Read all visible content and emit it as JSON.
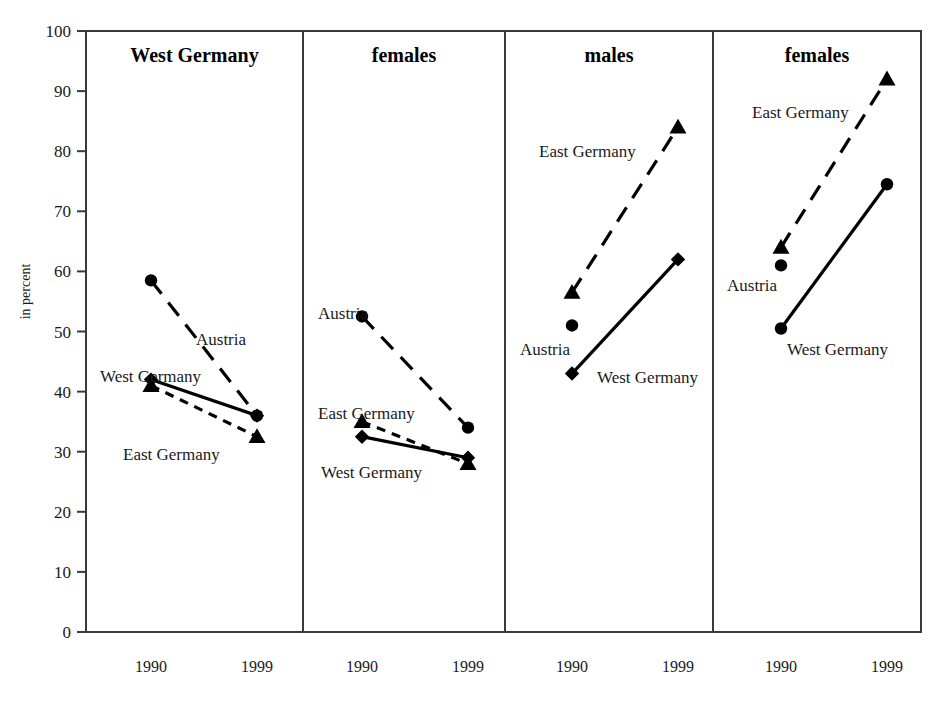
{
  "figure": {
    "y_axis_title": "in percent",
    "background": "#ffffff",
    "ink_color": "#000000"
  },
  "chart_data": {
    "type": "line",
    "title": "",
    "subtitle": "",
    "xlabel": "",
    "ylabel": "in percent",
    "ylim": [
      0,
      100
    ],
    "ytick_labels": [
      "0",
      "10",
      "20",
      "30",
      "40",
      "50",
      "60",
      "70",
      "80",
      "90",
      "100"
    ],
    "yticks": [
      0,
      10,
      20,
      30,
      40,
      50,
      60,
      70,
      80,
      90,
      100
    ],
    "grid": false,
    "legend_position": "inline-annotations",
    "x": [
      "1990",
      "1999"
    ],
    "panels": [
      {
        "title": "West Germany",
        "xtick_labels": [
          "1990",
          "1999"
        ],
        "series": [
          {
            "name": "Austria",
            "marker": "circle",
            "linestyle": "long-dash",
            "values": [
              58.5,
              36.0
            ],
            "label": "Austria",
            "label_x": 1999,
            "label_y": 1990
          },
          {
            "name": "West Germany",
            "marker": "diamond",
            "linestyle": "solid",
            "values": [
              42.0,
              36.0
            ],
            "label": "West Germany"
          },
          {
            "name": "East Germany",
            "marker": "triangle",
            "linestyle": "short-dash",
            "values": [
              41.0,
              32.5
            ],
            "label": "East Germany"
          }
        ]
      },
      {
        "title": "females",
        "xtick_labels": [
          "1990",
          "1999"
        ],
        "series": [
          {
            "name": "Austria",
            "marker": "circle",
            "linestyle": "long-dash",
            "values": [
              52.5,
              34.0
            ],
            "label": "Austria"
          },
          {
            "name": "East Germany",
            "marker": "triangle",
            "linestyle": "short-dash",
            "values": [
              35.0,
              28.0
            ],
            "label": "East Germany"
          },
          {
            "name": "West Germany",
            "marker": "diamond",
            "linestyle": "solid",
            "values": [
              32.5,
              29.0
            ],
            "label": "West Germany"
          }
        ]
      },
      {
        "title": "males",
        "xtick_labels": [
          "1990",
          "1999"
        ],
        "series": [
          {
            "name": "East Germany",
            "marker": "triangle",
            "linestyle": "long-dash",
            "values": [
              56.5,
              84.0
            ],
            "label": "East Germany"
          },
          {
            "name": "Austria",
            "marker": "circle",
            "linestyle": "none",
            "values": [
              51.0,
              null
            ],
            "label": "Austria"
          },
          {
            "name": "West Germany",
            "marker": "diamond",
            "linestyle": "solid",
            "values": [
              43.0,
              62.0
            ],
            "label": "West Germany"
          }
        ]
      },
      {
        "title": "females",
        "xtick_labels": [
          "1990",
          "1999"
        ],
        "series": [
          {
            "name": "East Germany",
            "marker": "triangle",
            "linestyle": "long-dash",
            "values": [
              64.0,
              92.0
            ],
            "label": "East Germany"
          },
          {
            "name": "Austria",
            "marker": "circle",
            "linestyle": "none",
            "values": [
              61.0,
              null
            ],
            "label": "Austria"
          },
          {
            "name": "West Germany",
            "marker": "circle",
            "linestyle": "solid",
            "values": [
              50.5,
              74.5
            ],
            "label": "West Germany"
          }
        ]
      }
    ],
    "annotations": [
      {
        "panel": 0,
        "text": "Austria",
        "x": 196,
        "y": 345,
        "anchor": "start"
      },
      {
        "panel": 0,
        "text": "West Germany",
        "x": 100,
        "y": 382,
        "anchor": "start"
      },
      {
        "panel": 0,
        "text": "East Germany",
        "x": 123,
        "y": 460,
        "anchor": "start"
      },
      {
        "panel": 1,
        "text": "Austria",
        "x": 318,
        "y": 319,
        "anchor": "start"
      },
      {
        "panel": 1,
        "text": "East Germany",
        "x": 318,
        "y": 419,
        "anchor": "start"
      },
      {
        "panel": 1,
        "text": "West Germany",
        "x": 321,
        "y": 478,
        "anchor": "start"
      },
      {
        "panel": 2,
        "text": "East Germany",
        "x": 539,
        "y": 157,
        "anchor": "start"
      },
      {
        "panel": 2,
        "text": "Austria",
        "x": 520,
        "y": 355,
        "anchor": "start"
      },
      {
        "panel": 2,
        "text": "West Germany",
        "x": 597,
        "y": 383,
        "anchor": "start"
      },
      {
        "panel": 3,
        "text": "East Germany",
        "x": 752,
        "y": 118,
        "anchor": "start"
      },
      {
        "panel": 3,
        "text": "Austria",
        "x": 727,
        "y": 291,
        "anchor": "start"
      },
      {
        "panel": 3,
        "text": "West Germany",
        "x": 787,
        "y": 355,
        "anchor": "start"
      }
    ]
  },
  "geometry": {
    "plot_left": 86,
    "plot_right": 921,
    "plot_top": 31,
    "plot_bottom": 632,
    "dividers": [
      303,
      505,
      713
    ],
    "panel_bounds": [
      [
        86,
        303
      ],
      [
        303,
        505
      ],
      [
        505,
        713
      ],
      [
        713,
        921
      ]
    ],
    "x_positions": [
      [
        151,
        257
      ],
      [
        362,
        468
      ],
      [
        572,
        678
      ],
      [
        781,
        887
      ]
    ],
    "panel_title_y": 62
  }
}
